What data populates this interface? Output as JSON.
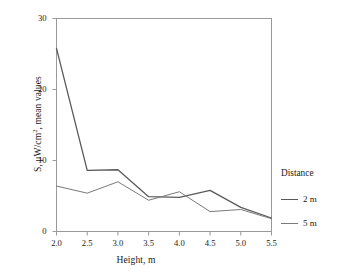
{
  "chart_data": {
    "type": "line",
    "title": "",
    "xlabel": "Height, m",
    "ylabel": "S, μW/cm², mean values",
    "x": [
      2.0,
      2.5,
      3.0,
      3.5,
      4.0,
      4.5,
      5.0,
      5.5
    ],
    "xticklabels": [
      "2.0",
      "2.5",
      "3.0",
      "3.5",
      "4.0",
      "4.5",
      "5.0",
      "5.5"
    ],
    "yticklabels": [
      "0",
      "10",
      "20",
      "30"
    ],
    "yticks": [
      0,
      10,
      20,
      30
    ],
    "xlim": [
      2.0,
      5.5
    ],
    "ylim": [
      0,
      30
    ],
    "grid": false,
    "legend_position": "right",
    "legend_title": "Distance",
    "series": [
      {
        "name": "2 m",
        "color": "#5a5a5a",
        "values": [
          25.8,
          8.6,
          8.7,
          4.9,
          4.8,
          5.8,
          3.4,
          1.9
        ]
      },
      {
        "name": "5 m",
        "color": "#7a7a7a",
        "values": [
          6.4,
          5.4,
          7.0,
          4.4,
          5.6,
          2.8,
          3.1,
          1.8
        ]
      }
    ]
  },
  "axis": {
    "frame_color": "#9a9a9a"
  }
}
